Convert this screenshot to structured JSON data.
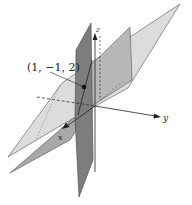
{
  "diagram": {
    "axes": {
      "x_label": "x",
      "y_label": "y",
      "z_label": "z"
    },
    "point": {
      "label": "(1, −1, 2)",
      "coords": [
        1,
        -1,
        2
      ]
    },
    "colors": {
      "plane_light": "#d9d9d9",
      "plane_medium": "#b3b3b3",
      "plane_dark": "#7a7a7a",
      "axis": "#222222",
      "background": "#ffffff"
    }
  }
}
